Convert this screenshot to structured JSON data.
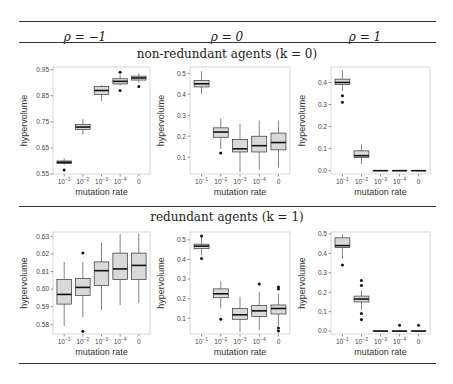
{
  "header": {
    "columns": [
      "ρ = −1",
      "ρ = 0",
      "ρ = 1"
    ]
  },
  "sections": [
    {
      "label": "non-redundant agents (k = 0)"
    },
    {
      "label": "redundant agents (k = 1)"
    }
  ],
  "colors": {
    "box_fill": "#d9d9d9",
    "box_stroke": "#333333",
    "frame": "#cccccc",
    "rule": "#333333"
  },
  "chart_data": [
    {
      "type": "box",
      "row": "non-redundant agents (k = 0)",
      "column": "ρ = -1",
      "categories": [
        "10^-1",
        "10^-2",
        "10^-3",
        "10^-4",
        "0"
      ],
      "xlabel": "mutation rate",
      "ylabel": "hypervolume",
      "ylim": [
        0.55,
        0.96
      ],
      "yticks": [
        0.55,
        0.65,
        0.75,
        0.85,
        0.95
      ],
      "boxes": [
        {
          "min": 0.585,
          "q1": 0.59,
          "median": 0.595,
          "q3": 0.6,
          "max": 0.61,
          "outliers": [
            0.565
          ]
        },
        {
          "min": 0.7,
          "q1": 0.72,
          "median": 0.73,
          "q3": 0.74,
          "max": 0.76,
          "outliers": []
        },
        {
          "min": 0.83,
          "q1": 0.855,
          "median": 0.87,
          "q3": 0.885,
          "max": 0.89,
          "outliers": []
        },
        {
          "min": 0.89,
          "q1": 0.895,
          "median": 0.905,
          "q3": 0.915,
          "max": 0.93,
          "outliers": [
            0.94,
            0.87
          ]
        },
        {
          "min": 0.9,
          "q1": 0.91,
          "median": 0.918,
          "q3": 0.925,
          "max": 0.935,
          "outliers": [
            0.885
          ]
        }
      ]
    },
    {
      "type": "box",
      "row": "non-redundant agents (k = 0)",
      "column": "ρ = 0",
      "categories": [
        "10^-1",
        "10^-2",
        "10^-3",
        "10^-4",
        "0"
      ],
      "xlabel": "mutation rate",
      "ylabel": "hypervolume",
      "ylim": [
        0.02,
        0.53
      ],
      "yticks": [
        0.1,
        0.2,
        0.3,
        0.4,
        0.5
      ],
      "boxes": [
        {
          "min": 0.4,
          "q1": 0.435,
          "median": 0.45,
          "q3": 0.465,
          "max": 0.51,
          "outliers": []
        },
        {
          "min": 0.14,
          "q1": 0.195,
          "median": 0.22,
          "q3": 0.24,
          "max": 0.285,
          "outliers": [
            0.12
          ]
        },
        {
          "min": 0.03,
          "q1": 0.125,
          "median": 0.14,
          "q3": 0.185,
          "max": 0.26,
          "outliers": []
        },
        {
          "min": 0.04,
          "q1": 0.125,
          "median": 0.155,
          "q3": 0.2,
          "max": 0.275,
          "outliers": []
        },
        {
          "min": 0.05,
          "q1": 0.135,
          "median": 0.17,
          "q3": 0.215,
          "max": 0.275,
          "outliers": []
        }
      ]
    },
    {
      "type": "box",
      "row": "non-redundant agents (k = 0)",
      "column": "ρ = 1",
      "categories": [
        "10^-1",
        "10^-2",
        "10^-3",
        "10^-4",
        "0"
      ],
      "xlabel": "mutation rate",
      "ylabel": "hypervolume",
      "ylim": [
        -0.015,
        0.47
      ],
      "yticks": [
        0.0,
        0.1,
        0.2,
        0.3,
        0.4
      ],
      "boxes": [
        {
          "min": 0.36,
          "q1": 0.39,
          "median": 0.4,
          "q3": 0.415,
          "max": 0.455,
          "outliers": [
            0.34,
            0.31
          ]
        },
        {
          "min": 0.03,
          "q1": 0.06,
          "median": 0.068,
          "q3": 0.09,
          "max": 0.12,
          "outliers": []
        },
        {
          "min": 0.0,
          "q1": 0.0,
          "median": 0.0,
          "q3": 0.0,
          "max": 0.0,
          "outliers": []
        },
        {
          "min": 0.0,
          "q1": 0.0,
          "median": 0.0,
          "q3": 0.0,
          "max": 0.0,
          "outliers": []
        },
        {
          "min": 0.0,
          "q1": 0.0,
          "median": 0.0,
          "q3": 0.0,
          "max": 0.0,
          "outliers": []
        }
      ]
    },
    {
      "type": "box",
      "row": "redundant agents (k = 1)",
      "column": "ρ = -1",
      "categories": [
        "10^-1",
        "10^-2",
        "10^-3",
        "10^-4",
        "0"
      ],
      "xlabel": "mutation rate",
      "ylabel": "hypervolume",
      "ylim": [
        0.5745,
        0.6325
      ],
      "yticks": [
        0.58,
        0.59,
        0.6,
        0.61,
        0.62,
        0.63
      ],
      "boxes": [
        {
          "min": 0.579,
          "q1": 0.5915,
          "median": 0.597,
          "q3": 0.6055,
          "max": 0.6155,
          "outliers": []
        },
        {
          "min": 0.584,
          "q1": 0.5965,
          "median": 0.601,
          "q3": 0.606,
          "max": 0.6155,
          "outliers": [
            0.6205,
            0.576
          ]
        },
        {
          "min": 0.588,
          "q1": 0.602,
          "median": 0.6105,
          "q3": 0.6155,
          "max": 0.6265,
          "outliers": []
        },
        {
          "min": 0.591,
          "q1": 0.6055,
          "median": 0.6115,
          "q3": 0.6205,
          "max": 0.6315,
          "outliers": []
        },
        {
          "min": 0.592,
          "q1": 0.6055,
          "median": 0.6135,
          "q3": 0.6205,
          "max": 0.6315,
          "outliers": []
        }
      ]
    },
    {
      "type": "box",
      "row": "redundant agents (k = 1)",
      "column": "ρ = 0",
      "categories": [
        "10^-1",
        "10^-2",
        "10^-3",
        "10^-4",
        "0"
      ],
      "xlabel": "mutation rate",
      "ylabel": "hypervolume",
      "ylim": [
        0.02,
        0.54
      ],
      "yticks": [
        0.1,
        0.2,
        0.3,
        0.4,
        0.5
      ],
      "boxes": [
        {
          "min": 0.42,
          "q1": 0.455,
          "median": 0.468,
          "q3": 0.478,
          "max": 0.52,
          "outliers": [
            0.52,
            0.405
          ]
        },
        {
          "min": 0.15,
          "q1": 0.205,
          "median": 0.225,
          "q3": 0.25,
          "max": 0.29,
          "outliers": [
            0.095
          ]
        },
        {
          "min": 0.03,
          "q1": 0.095,
          "median": 0.118,
          "q3": 0.15,
          "max": 0.21,
          "outliers": []
        },
        {
          "min": 0.04,
          "q1": 0.11,
          "median": 0.138,
          "q3": 0.165,
          "max": 0.235,
          "outliers": [
            0.275
          ]
        },
        {
          "min": 0.06,
          "q1": 0.122,
          "median": 0.15,
          "q3": 0.168,
          "max": 0.225,
          "outliers": [
            0.26,
            0.25,
            0.05,
            0.035
          ]
        }
      ]
    },
    {
      "type": "box",
      "row": "redundant agents (k = 1)",
      "column": "ρ = 1",
      "categories": [
        "10^-1",
        "10^-2",
        "10^-3",
        "10^-4",
        "0"
      ],
      "xlabel": "mutation rate",
      "ylabel": "hypervolume",
      "ylim": [
        -0.015,
        0.51
      ],
      "yticks": [
        0.0,
        0.1,
        0.2,
        0.3,
        0.4,
        0.5
      ],
      "boxes": [
        {
          "min": 0.37,
          "q1": 0.43,
          "median": 0.44,
          "q3": 0.48,
          "max": 0.5,
          "outliers": [
            0.34
          ]
        },
        {
          "min": 0.11,
          "q1": 0.15,
          "median": 0.165,
          "q3": 0.18,
          "max": 0.21,
          "outliers": [
            0.26,
            0.235,
            0.09,
            0.06
          ]
        },
        {
          "min": 0.0,
          "q1": 0.0,
          "median": 0.0,
          "q3": 0.0,
          "max": 0.0,
          "outliers": []
        },
        {
          "min": 0.0,
          "q1": 0.0,
          "median": 0.0,
          "q3": 0.0,
          "max": 0.0,
          "outliers": [
            0.03
          ]
        },
        {
          "min": 0.0,
          "q1": 0.0,
          "median": 0.0,
          "q3": 0.0,
          "max": 0.0,
          "outliers": [
            0.03
          ]
        }
      ]
    }
  ],
  "layout": {
    "panels": [
      {
        "x0": 53,
        "x1": 150,
        "y0": 67,
        "y1": 174
      },
      {
        "x0": 190,
        "x1": 290,
        "y0": 67,
        "y1": 174
      },
      {
        "x0": 331,
        "x1": 430,
        "y0": 67,
        "y1": 174
      },
      {
        "x0": 53,
        "x1": 150,
        "y0": 232,
        "y1": 334
      },
      {
        "x0": 190,
        "x1": 290,
        "y0": 232,
        "y1": 334
      },
      {
        "x0": 331,
        "x1": 430,
        "y0": 232,
        "y1": 334
      }
    ]
  }
}
